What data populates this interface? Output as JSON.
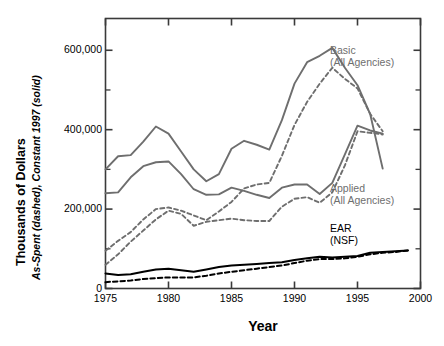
{
  "figure": {
    "width": 444,
    "height": 346,
    "background": "#ffffff"
  },
  "axes": {
    "y_title_bold": "Thousands of Dollars",
    "y_title_italic": "As-Spent (dashed), Constant 1997 (solid)",
    "x_title": "Year",
    "y_ticks": [
      "0",
      "200,000",
      "400,000",
      "600,000"
    ],
    "x_ticks": [
      "1975",
      "1980",
      "1985",
      "1990",
      "1995",
      "2000"
    ]
  },
  "annotations": [
    {
      "name": "basic-label",
      "line1": "Basic",
      "line2": "(All Agencies)",
      "color": "#6e6e6e",
      "x": 330,
      "y": 44
    },
    {
      "name": "applied-label",
      "line1": "Applied",
      "line2": "(All Agencies)",
      "color": "#6e6e6e",
      "x": 330,
      "y": 182
    },
    {
      "name": "ear-label",
      "line1": "EAR",
      "line2": "(NSF)",
      "color": "#000000",
      "x": 330,
      "y": 222
    }
  ],
  "colors": {
    "gray_series": "#6e6e6e",
    "black_series": "#000000",
    "frame": "#3a3a3a",
    "text": "#000000"
  },
  "chart_data": {
    "type": "line",
    "title": "",
    "subtitle": "",
    "xlabel": "Year",
    "ylabel": "Thousands of Dollars",
    "ylabel_secondary": "As-Spent (dashed), Constant 1997 (solid)",
    "xlim": [
      1975,
      2000
    ],
    "ylim": [
      0,
      680000
    ],
    "grid": false,
    "legend": "annotations-on-plot",
    "y_ticks": [
      0,
      200000,
      400000,
      600000
    ],
    "y_minor_ticks": [
      100000,
      300000,
      500000,
      600000
    ],
    "x_ticks": [
      1975,
      1980,
      1985,
      1990,
      1995,
      2000
    ],
    "series": [
      {
        "name": "Basic (All Agencies) — Constant 1997",
        "style": "solid",
        "color": "#6e6e6e",
        "x": [
          1975,
          1976,
          1977,
          1978,
          1979,
          1980,
          1981,
          1982,
          1983,
          1984,
          1985,
          1986,
          1987,
          1988,
          1989,
          1990,
          1991,
          1992,
          1993,
          1994,
          1995,
          1996,
          1997
        ],
        "values": [
          300000,
          333000,
          336000,
          370000,
          408000,
          390000,
          345000,
          300000,
          270000,
          288000,
          352000,
          372000,
          362000,
          350000,
          424000,
          516000,
          570000,
          586000,
          606000,
          556000,
          512000,
          440000,
          302000
        ]
      },
      {
        "name": "Applied (All Agencies) — Constant 1997",
        "style": "solid",
        "color": "#6e6e6e",
        "x": [
          1975,
          1976,
          1977,
          1978,
          1979,
          1980,
          1981,
          1982,
          1983,
          1984,
          1985,
          1986,
          1987,
          1988,
          1989,
          1990,
          1991,
          1992,
          1993,
          1994,
          1995,
          1996,
          1997
        ],
        "values": [
          240000,
          242000,
          280000,
          308000,
          318000,
          320000,
          288000,
          250000,
          236000,
          237000,
          254000,
          246000,
          236000,
          228000,
          254000,
          262000,
          262000,
          238000,
          266000,
          338000,
          410000,
          398000,
          390000
        ]
      },
      {
        "name": "Basic (All Agencies) — As-Spent",
        "style": "dashed",
        "color": "#6e6e6e",
        "x": [
          1975,
          1976,
          1977,
          1978,
          1979,
          1980,
          1981,
          1982,
          1983,
          1984,
          1985,
          1986,
          1987,
          1988,
          1989,
          1990,
          1991,
          1992,
          1993,
          1994,
          1995,
          1996,
          1997
        ],
        "values": [
          95000,
          120000,
          142000,
          174000,
          200000,
          204000,
          196000,
          184000,
          172000,
          194000,
          218000,
          252000,
          262000,
          266000,
          334000,
          412000,
          470000,
          516000,
          556000,
          528000,
          504000,
          440000,
          396000
        ]
      },
      {
        "name": "Applied (All Agencies) — As-Spent",
        "style": "dashed",
        "color": "#6e6e6e",
        "x": [
          1975,
          1976,
          1977,
          1978,
          1979,
          1980,
          1981,
          1982,
          1983,
          1984,
          1985,
          1986,
          1987,
          1988,
          1989,
          1990,
          1991,
          1992,
          1993,
          1994,
          1995,
          1996,
          1997
        ],
        "values": [
          60000,
          86000,
          118000,
          146000,
          174000,
          196000,
          188000,
          158000,
          168000,
          172000,
          176000,
          172000,
          170000,
          170000,
          206000,
          226000,
          230000,
          216000,
          242000,
          310000,
          396000,
          392000,
          388000
        ]
      },
      {
        "name": "EAR (NSF) — Constant 1997",
        "style": "solid",
        "color": "#000000",
        "x": [
          1975,
          1976,
          1977,
          1978,
          1979,
          1980,
          1981,
          1982,
          1983,
          1984,
          1985,
          1986,
          1987,
          1988,
          1989,
          1990,
          1991,
          1992,
          1993,
          1994,
          1995,
          1996,
          1997,
          1998,
          1999
        ],
        "values": [
          38000,
          34000,
          36000,
          42000,
          48000,
          50000,
          46000,
          42000,
          48000,
          54000,
          58000,
          60000,
          62000,
          64000,
          66000,
          72000,
          76000,
          80000,
          78000,
          80000,
          82000,
          90000,
          92000,
          94000,
          96000
        ]
      },
      {
        "name": "EAR (NSF) — As-Spent",
        "style": "dashed",
        "color": "#000000",
        "x": [
          1975,
          1976,
          1977,
          1978,
          1979,
          1980,
          1981,
          1982,
          1983,
          1984,
          1985,
          1986,
          1987,
          1988,
          1989,
          1990,
          1991,
          1992,
          1993,
          1994,
          1995,
          1996,
          1997,
          1998,
          1999
        ],
        "values": [
          16000,
          18000,
          20000,
          24000,
          26000,
          28000,
          28000,
          28000,
          32000,
          38000,
          42000,
          46000,
          50000,
          54000,
          58000,
          64000,
          70000,
          74000,
          74000,
          76000,
          80000,
          86000,
          90000,
          92000,
          96000
        ]
      }
    ]
  }
}
